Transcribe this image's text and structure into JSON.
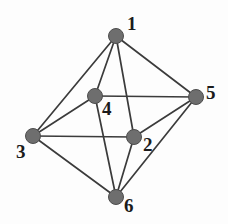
{
  "figure": {
    "title": "",
    "type": "undirected-graph-diagram",
    "background_color": "#fdfdfd",
    "node_color": "#6e6e6e",
    "node_stroke_color": "#4d4d4d",
    "edge_color": "#3b3b3b",
    "label_color": "#1b1b1b"
  },
  "graph_data": {
    "type": "graph",
    "directed": false,
    "node_count": 6,
    "edge_count": 12,
    "nodes": [
      {
        "id": "1",
        "label": "1",
        "x": 116,
        "y": 36,
        "r": 7.5,
        "label_x": 127,
        "label_y": 14
      },
      {
        "id": "2",
        "label": "2",
        "x": 134,
        "y": 137,
        "r": 7.5,
        "label_x": 143,
        "label_y": 135
      },
      {
        "id": "3",
        "label": "3",
        "x": 33,
        "y": 136,
        "r": 7.5,
        "label_x": 16,
        "label_y": 142
      },
      {
        "id": "4",
        "label": "4",
        "x": 95,
        "y": 96,
        "r": 7.5,
        "label_x": 102,
        "label_y": 99
      },
      {
        "id": "5",
        "label": "5",
        "x": 196,
        "y": 97,
        "r": 7.5,
        "label_x": 206,
        "label_y": 83
      },
      {
        "id": "6",
        "label": "6",
        "x": 116,
        "y": 197,
        "r": 7.5,
        "label_x": 124,
        "label_y": 196
      }
    ],
    "edges": [
      {
        "source": "1",
        "target": "2"
      },
      {
        "source": "1",
        "target": "3"
      },
      {
        "source": "1",
        "target": "4"
      },
      {
        "source": "1",
        "target": "5"
      },
      {
        "source": "2",
        "target": "3"
      },
      {
        "source": "2",
        "target": "5"
      },
      {
        "source": "2",
        "target": "6"
      },
      {
        "source": "3",
        "target": "4"
      },
      {
        "source": "3",
        "target": "6"
      },
      {
        "source": "4",
        "target": "5"
      },
      {
        "source": "4",
        "target": "6"
      },
      {
        "source": "5",
        "target": "6"
      }
    ]
  }
}
